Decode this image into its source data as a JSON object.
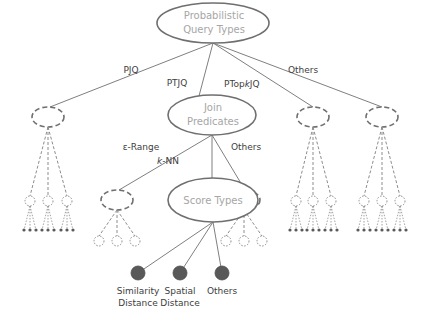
{
  "colors": {
    "line": "#7f7f7f",
    "ellipse_stroke": "#6f6f6f",
    "node_text": "#a6a6a6",
    "edge_label": "#404040",
    "leaf_fill": "#595959",
    "dashed": "#6f6f6f",
    "dotted": "#8c8c8c"
  },
  "root": {
    "label_line1": "Probabilistic",
    "label_line2": "Query Types"
  },
  "level1_edges": [
    {
      "label": "PJQ"
    },
    {
      "label": "PTJQ"
    },
    {
      "label": "PTopkJQ",
      "label_prefix": "PTop",
      "label_italic": "k",
      "label_suffix": "JQ"
    },
    {
      "label": "Others"
    }
  ],
  "join_predicates": {
    "label_line1": "Join",
    "label_line2": "Predicates"
  },
  "level2_edges": [
    {
      "label": "ε-Range"
    },
    {
      "label": "k-NN",
      "label_italic": "k",
      "label_suffix": "-NN"
    },
    {
      "label": "Others"
    }
  ],
  "score_types": {
    "label": "Score Types"
  },
  "leaves": [
    {
      "label_line1": "Similarity",
      "label_line2": "Distance"
    },
    {
      "label_line1": "Spatial",
      "label_line2": "Distance"
    },
    {
      "label_line1": "Others",
      "label_line2": ""
    }
  ]
}
